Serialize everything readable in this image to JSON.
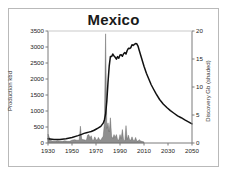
{
  "chart_data": {
    "type": "area",
    "title": "Mexico",
    "xlabel": "",
    "ylabel": "Production kbd",
    "y2label": "Discovery Gb (shaded)",
    "grid": false,
    "legend": "none",
    "xlim": [
      1930,
      2050
    ],
    "ylim": [
      0,
      3500
    ],
    "y2lim": [
      0,
      20
    ],
    "xticks": [
      1930,
      1950,
      1970,
      1990,
      2010,
      2030,
      2050
    ],
    "yticks": [
      0,
      500,
      1000,
      1500,
      2000,
      2500,
      3000,
      3500
    ],
    "y2ticks": [
      0,
      5,
      10,
      15,
      20
    ],
    "series": [
      {
        "name": "Production kbd",
        "axis": "left",
        "style": "line",
        "color": "#111111",
        "x": [
          1930,
          1935,
          1940,
          1945,
          1950,
          1955,
          1958,
          1960,
          1962,
          1964,
          1966,
          1968,
          1970,
          1972,
          1974,
          1976,
          1977,
          1978,
          1979,
          1980,
          1981,
          1982,
          1983,
          1984,
          1985,
          1986,
          1987,
          1988,
          1989,
          1990,
          1991,
          1992,
          1993,
          1994,
          1995,
          1996,
          1997,
          1998,
          1999,
          2000,
          2001,
          2002,
          2003,
          2004,
          2005,
          2006,
          2008,
          2010,
          2012,
          2014,
          2016,
          2018,
          2020,
          2023,
          2026,
          2029,
          2032,
          2035,
          2038,
          2041,
          2044,
          2047,
          2050
        ],
        "y": [
          130,
          110,
          110,
          130,
          170,
          230,
          270,
          300,
          320,
          340,
          360,
          390,
          430,
          470,
          520,
          620,
          720,
          900,
          1300,
          1900,
          2400,
          2700,
          2700,
          2780,
          2720,
          2680,
          2620,
          2700,
          2650,
          2750,
          2760,
          2710,
          2790,
          2830,
          2780,
          2890,
          2960,
          2950,
          2980,
          3070,
          3050,
          3080,
          3110,
          3100,
          3030,
          2900,
          2650,
          2400,
          2180,
          2000,
          1820,
          1680,
          1540,
          1360,
          1220,
          1110,
          1010,
          930,
          850,
          790,
          720,
          660,
          600
        ]
      },
      {
        "name": "Discovery Gb (shaded)",
        "axis": "right",
        "style": "area",
        "color": "#8f8f8f",
        "x": [
          1930,
          1932,
          1934,
          1936,
          1938,
          1940,
          1942,
          1944,
          1946,
          1948,
          1950,
          1952,
          1954,
          1956,
          1957,
          1958,
          1959,
          1960,
          1961,
          1962,
          1963,
          1964,
          1965,
          1966,
          1967,
          1968,
          1969,
          1970,
          1971,
          1972,
          1973,
          1974,
          1975,
          1976,
          1977,
          1978,
          1979,
          1980,
          1981,
          1982,
          1983,
          1984,
          1985,
          1986,
          1987,
          1988,
          1989,
          1990,
          1991,
          1992,
          1993,
          1994,
          1995,
          1996,
          1997,
          1998,
          1999,
          2000,
          2001,
          2002,
          2003,
          2004,
          2005,
          2006,
          2007,
          2008,
          2010
        ],
        "y": [
          1.6,
          0.5,
          0.3,
          0.3,
          0.4,
          0.3,
          0.3,
          0.4,
          0.3,
          0.3,
          0.5,
          0.6,
          0.5,
          0.5,
          3.0,
          0.8,
          0.6,
          0.6,
          0.5,
          0.5,
          1.4,
          1.5,
          0.9,
          1.3,
          0.5,
          0.5,
          1.1,
          0.6,
          0.5,
          1.0,
          0.6,
          0.5,
          0.9,
          1.2,
          3.5,
          19.5,
          2.6,
          3.6,
          2.0,
          4.5,
          1.2,
          0.8,
          1.5,
          1.0,
          1.5,
          0.6,
          0.5,
          1.5,
          0.8,
          2.4,
          0.5,
          0.4,
          3.1,
          0.6,
          1.4,
          0.6,
          0.5,
          1.1,
          0.5,
          0.4,
          1.0,
          0.4,
          0.3,
          0.6,
          0.4,
          0.3,
          0.2
        ]
      }
    ]
  }
}
